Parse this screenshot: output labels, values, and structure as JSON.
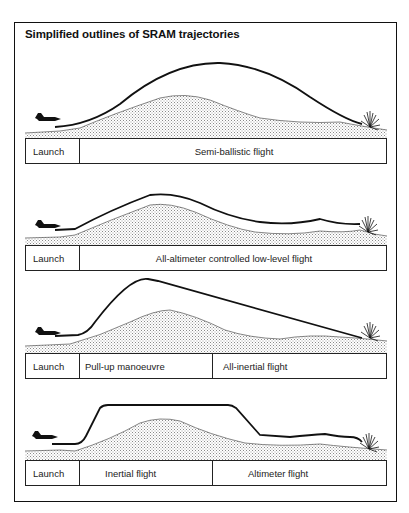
{
  "title": "Simplified outlines of SRAM trajectories",
  "icons": {
    "aircraft": "aircraft-icon",
    "impact": "explosion-icon"
  },
  "colors": {
    "line": "#111111",
    "terrain_fill": "#d8d8d8",
    "background": "#ffffff"
  },
  "panels": [
    {
      "name": "semi-ballistic",
      "phases": [
        {
          "label": "Launch"
        },
        {
          "label": "Semi-ballistic flight"
        }
      ]
    },
    {
      "name": "low-level",
      "phases": [
        {
          "label": "Launch"
        },
        {
          "label": "All-altimeter controlled low-level flight"
        }
      ]
    },
    {
      "name": "pull-up-inertial",
      "phases": [
        {
          "label": "Launch"
        },
        {
          "label": "Pull-up manoeuvre"
        },
        {
          "label": "All-inertial flight"
        }
      ]
    },
    {
      "name": "inertial-altimeter",
      "phases": [
        {
          "label": "Launch"
        },
        {
          "label": "Inertial flight"
        },
        {
          "label": "Altimeter flight"
        }
      ]
    }
  ]
}
